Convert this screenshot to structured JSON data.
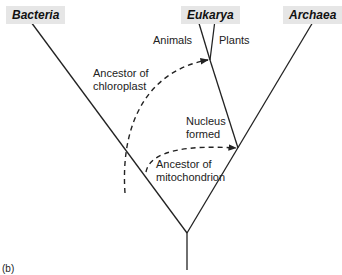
{
  "diagram": {
    "panel_label": "(b)",
    "domains": [
      {
        "name": "Bacteria"
      },
      {
        "name": "Eukarya"
      },
      {
        "name": "Archaea"
      }
    ],
    "branches": {
      "animals": "Animals",
      "plants": "Plants"
    },
    "annotations": {
      "chloroplast_line1": "Ancestor of",
      "chloroplast_line2": "chloroplast",
      "nucleus_line1": "Nucleus",
      "nucleus_line2": "formed",
      "mito_line1": "Ancestor of",
      "mito_line2": "mitochondrion"
    },
    "colors": {
      "line": "#222222",
      "label_bg": "#e6e6e6"
    }
  }
}
